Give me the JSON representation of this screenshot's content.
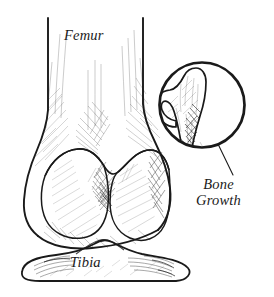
{
  "figure": {
    "background_color": "#ffffff",
    "ink_color": "#1a1a1a",
    "width": 274,
    "height": 297,
    "technique": "pen-and-ink hatching medical illustration"
  },
  "labels": {
    "femur": "Femur",
    "tibia": "Tibia",
    "bone_growth": "Bone\nGrowth"
  },
  "callout": {
    "shape": "circle",
    "center_x": 202,
    "center_y": 105,
    "radius": 44,
    "stroke_width": 2.6,
    "contents": "osteophyte-bone-spur",
    "leader_line": {
      "from_x": 218,
      "from_y": 146,
      "to_x": 232,
      "to_y": 174
    }
  },
  "structures": [
    {
      "name": "femur-shaft",
      "description": "Distal femoral shaft flaring into condyles"
    },
    {
      "name": "medial-femoral-condyle",
      "description": "Rounded medial condyle, left side"
    },
    {
      "name": "lateral-femoral-condyle",
      "description": "Rounded lateral condyle, right side"
    },
    {
      "name": "intercondylar-notch",
      "description": "Shaded notch between condyles"
    },
    {
      "name": "tibial-plateau",
      "description": "Proximal tibia with intercondylar eminence"
    },
    {
      "name": "osteophyte",
      "description": "Hooked bone spur on lateral femoral margin"
    }
  ]
}
